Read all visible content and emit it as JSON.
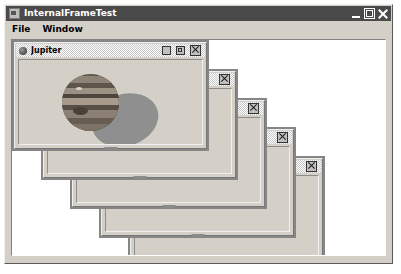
{
  "window": {
    "title": "InternalFrameTest",
    "app_icon": "application-icon",
    "controls": [
      {
        "name": "minimize",
        "label": "Minimize"
      },
      {
        "name": "maximize",
        "label": "Maximize"
      },
      {
        "name": "close",
        "label": "Close"
      }
    ]
  },
  "menubar": {
    "items": [
      {
        "label": "File"
      },
      {
        "label": "Window"
      }
    ]
  },
  "desktop": {
    "background": "#ffffff",
    "frames": [
      {
        "title": "Jupiter",
        "active": true,
        "icon": "planet-icon",
        "left": 0,
        "top": 0,
        "width": 197,
        "height": 111,
        "z": 5,
        "buttons": [
          {
            "name": "iconify",
            "label": "Iconify"
          },
          {
            "name": "maximize",
            "label": "Maximize"
          },
          {
            "name": "close",
            "label": "Close"
          }
        ],
        "image": {
          "name": "jupiter-image",
          "alt": "Jupiter planet with shadow"
        }
      },
      {
        "title": "",
        "active": false,
        "left": 29,
        "top": 29,
        "width": 197,
        "height": 111,
        "z": 4,
        "buttons": [
          {
            "name": "close",
            "label": "Close"
          }
        ]
      },
      {
        "title": "",
        "active": false,
        "left": 58,
        "top": 58,
        "width": 197,
        "height": 111,
        "z": 3,
        "buttons": [
          {
            "name": "close",
            "label": "Close"
          }
        ]
      },
      {
        "title": "",
        "active": false,
        "left": 87,
        "top": 87,
        "width": 197,
        "height": 111,
        "z": 2,
        "buttons": [
          {
            "name": "close",
            "label": "Close"
          }
        ]
      },
      {
        "title": "",
        "active": false,
        "left": 116,
        "top": 116,
        "width": 197,
        "height": 111,
        "z": 1,
        "buttons": [
          {
            "name": "close",
            "label": "Close"
          }
        ]
      }
    ]
  },
  "colors": {
    "titlebar_bg": "#4a4a4a",
    "titlebar_text": "#ffffff",
    "chrome": "#d4d0c8",
    "desktop_bg": "#ffffff",
    "frame_border": "#868686"
  }
}
